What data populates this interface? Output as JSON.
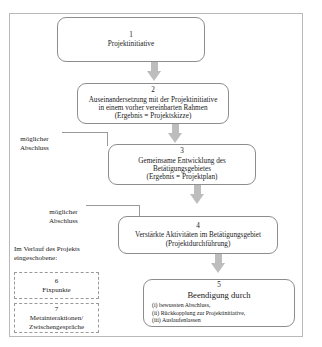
{
  "diagram": {
    "title_present": false,
    "frame_color": "#b9b9b9",
    "arrow_color": "#bdbdbd",
    "nodes": [
      {
        "number": "1",
        "lines": [
          "Projektinitiative"
        ],
        "style": "rounded"
      },
      {
        "number": "2",
        "lines": [
          "Auseinandersetzung mit der Projektinitiative",
          "in einem vorher vereinbarten Rahmen",
          "(Ergebnis = Projektskizze)"
        ],
        "style": "rounded"
      },
      {
        "number": "3",
        "lines": [
          "Gemeinsame Entwicklung des",
          "Betätigungsgebietes",
          "(Ergebnis = Projektplan)"
        ],
        "style": "rounded"
      },
      {
        "number": "4",
        "lines": [
          "Verstärkte Aktivitäten im Betätigungsgebiet",
          "(Projektdurchführung)"
        ],
        "style": "rounded"
      },
      {
        "number": "5",
        "heading": "Beendigung durch",
        "lines": [
          "(i) bewussten Abschluss,",
          "(ii) Rückkopplung zur Projektinitiative,",
          "(iii) Auslaufenlassen"
        ],
        "style": "rounded"
      },
      {
        "number": "6",
        "lines": [
          "Fixpunkte"
        ],
        "style": "dashed"
      },
      {
        "number": "7",
        "lines": [
          "Metainteraktionen/",
          "Zwischengespräche"
        ],
        "style": "dashed"
      }
    ],
    "side_labels": [
      {
        "line1": "möglicher",
        "line2": "Abschluss"
      },
      {
        "line1": "möglicher",
        "line2": "Abschluss"
      }
    ],
    "intro_note": {
      "line1": "Im Verlauf des Projekts",
      "line2": "eingeschobene:"
    }
  }
}
